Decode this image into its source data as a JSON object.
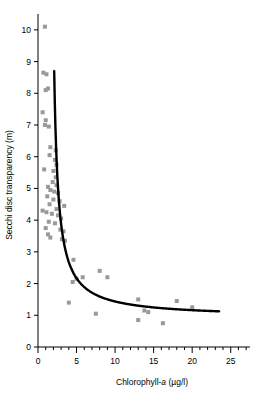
{
  "chart_data": {
    "type": "scatter",
    "title": "",
    "xlabel": "Chlorophyll-a (µg/l)",
    "xlabel_parts": {
      "pre": "Chlorophyll-",
      "italic": "a",
      "post": " (µg/l)"
    },
    "ylabel": "Secchi disc transparency (m)",
    "xlim": [
      0,
      27.5
    ],
    "ylim": [
      0,
      10.5
    ],
    "xticks": [
      0,
      5,
      10,
      15,
      20,
      25
    ],
    "xticklabels": [
      "0",
      "5",
      "10",
      "15",
      "20",
      "25"
    ],
    "xminor_step": 1,
    "yticks": [
      0,
      1,
      2,
      3,
      4,
      5,
      6,
      7,
      8,
      9,
      10
    ],
    "yticklabels": [
      "0",
      "1",
      "2",
      "3",
      "4",
      "5",
      "6",
      "7",
      "8",
      "9",
      "10"
    ],
    "grid": false,
    "legend": "none",
    "marker": {
      "shape": "square",
      "size": 4,
      "color": "#999999"
    },
    "points": [
      [
        0.9,
        10.1
      ],
      [
        0.7,
        8.65
      ],
      [
        1.1,
        8.6
      ],
      [
        1.0,
        8.1
      ],
      [
        1.3,
        8.15
      ],
      [
        0.6,
        7.4
      ],
      [
        1.0,
        7.15
      ],
      [
        0.9,
        7.0
      ],
      [
        1.4,
        6.95
      ],
      [
        1.6,
        6.3
      ],
      [
        2.3,
        6.2
      ],
      [
        1.5,
        6.05
      ],
      [
        2.2,
        5.9
      ],
      [
        2.4,
        5.75
      ],
      [
        0.8,
        5.6
      ],
      [
        2.0,
        5.55
      ],
      [
        2.3,
        5.35
      ],
      [
        1.9,
        5.2
      ],
      [
        2.4,
        5.1
      ],
      [
        1.3,
        5.05
      ],
      [
        1.6,
        4.95
      ],
      [
        2.1,
        4.9
      ],
      [
        2.6,
        4.85
      ],
      [
        1.2,
        4.75
      ],
      [
        2.0,
        4.65
      ],
      [
        2.8,
        4.6
      ],
      [
        1.5,
        4.5
      ],
      [
        3.4,
        4.45
      ],
      [
        2.4,
        4.35
      ],
      [
        0.6,
        4.3
      ],
      [
        1.1,
        4.25
      ],
      [
        1.8,
        4.2
      ],
      [
        2.6,
        4.15
      ],
      [
        3.0,
        4.05
      ],
      [
        1.4,
        3.95
      ],
      [
        2.2,
        3.9
      ],
      [
        1.0,
        3.75
      ],
      [
        2.9,
        3.7
      ],
      [
        3.3,
        3.65
      ],
      [
        1.3,
        3.55
      ],
      [
        1.6,
        3.45
      ],
      [
        3.1,
        3.4
      ],
      [
        3.5,
        3.35
      ],
      [
        4.6,
        2.75
      ],
      [
        8.0,
        2.4
      ],
      [
        5.8,
        2.2
      ],
      [
        9.0,
        2.2
      ],
      [
        5.0,
        2.15
      ],
      [
        4.5,
        2.05
      ],
      [
        4.0,
        1.4
      ],
      [
        13.0,
        1.5
      ],
      [
        18.0,
        1.45
      ],
      [
        20.0,
        1.25
      ],
      [
        13.8,
        1.15
      ],
      [
        14.3,
        1.1
      ],
      [
        7.5,
        1.05
      ],
      [
        13.0,
        0.85
      ],
      [
        16.2,
        0.75
      ]
    ],
    "fitted_curve": {
      "description": "Hyperbolic decay fit",
      "x_start": 2.1,
      "x_end": 23.5,
      "y_start": 8.7,
      "y_end": 0.97,
      "color": "#000000",
      "width": 2.4
    }
  }
}
